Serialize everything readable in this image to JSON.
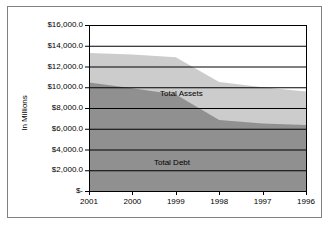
{
  "chart_data": {
    "type": "area",
    "title": "",
    "subtitle": "",
    "xlabel": "",
    "ylabel": "In Millions",
    "categories": [
      "2001",
      "2000",
      "1999",
      "1998",
      "1997",
      "1996"
    ],
    "series": [
      {
        "name": "Total Assets",
        "values": [
          13300,
          13150,
          12900,
          10500,
          10000,
          9600
        ],
        "color": "#cccccc"
      },
      {
        "name": "Total Debt",
        "values": [
          10450,
          9900,
          9300,
          6850,
          6500,
          6350
        ],
        "color": "#909090"
      }
    ],
    "ylim": [
      0,
      16000
    ],
    "ytick_values": [
      16000,
      14000,
      12000,
      10000,
      8000,
      6000,
      4000,
      2000,
      0
    ],
    "ytick_labels": [
      "$16,000.0",
      "$14,000.0",
      "$12,000.0",
      "$10,000.0",
      "$8,000.0",
      "$6,000.0",
      "$4,000.0",
      "$2,000.0",
      "$-"
    ],
    "grid": true,
    "grid_axis": "y",
    "legend_position": "inline-annotations",
    "annotations": [
      {
        "text": "Total Assets",
        "series": "Total Assets"
      },
      {
        "text": "Total Debt",
        "series": "Total Debt"
      }
    ],
    "stacked": false,
    "note": "Overlapping area series; Total Assets drawn behind Total Debt"
  },
  "style": {
    "plot_background": "#ffffff",
    "border_color": "#808080",
    "gridline_color": "#000000",
    "axis_color": "#000000",
    "text_color": "#000000"
  }
}
